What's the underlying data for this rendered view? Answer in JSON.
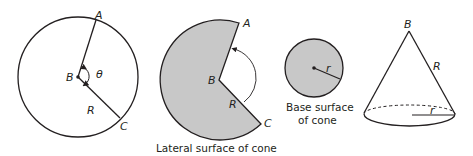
{
  "colors": {
    "stroke": "#231f20",
    "fill_gray": "#c8c8c8",
    "background": "#ffffff"
  },
  "full_circle": {
    "labels": {
      "A": "A",
      "B": "B",
      "C": "C",
      "R": "R",
      "theta": "θ"
    }
  },
  "lateral_surface": {
    "labels": {
      "A": "A",
      "B": "B",
      "C": "C",
      "R": "R"
    },
    "caption": "Lateral surface of cone"
  },
  "base_surface": {
    "labels": {
      "r": "r"
    },
    "caption_line1": "Base surface",
    "caption_line2": "of cone"
  },
  "cone": {
    "labels": {
      "B": "B",
      "R": "R",
      "r": "r"
    }
  }
}
